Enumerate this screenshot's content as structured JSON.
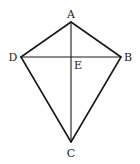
{
  "figure": {
    "type": "kite",
    "width": 140,
    "height": 164,
    "background": "#ffffff",
    "stroke_color": "#1a1a1a",
    "points": {
      "A": {
        "label": "A",
        "x": 71,
        "y": 22,
        "label_x": 71,
        "label_y": 18
      },
      "B": {
        "label": "B",
        "x": 121,
        "y": 57,
        "label_x": 128,
        "label_y": 61
      },
      "C": {
        "label": "C",
        "x": 71,
        "y": 142,
        "label_x": 71,
        "label_y": 157
      },
      "D": {
        "label": "D",
        "x": 21,
        "y": 57,
        "label_x": 13,
        "label_y": 61
      },
      "E": {
        "label": "E",
        "x": 71,
        "y": 57,
        "label_x": 78,
        "label_y": 69
      }
    },
    "edges": [
      [
        "A",
        "B"
      ],
      [
        "B",
        "C"
      ],
      [
        "C",
        "D"
      ],
      [
        "D",
        "A"
      ]
    ],
    "diagonals": [
      [
        "A",
        "C"
      ],
      [
        "D",
        "B"
      ]
    ]
  }
}
